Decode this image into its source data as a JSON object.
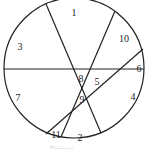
{
  "diagram": {
    "type": "circle-divided-by-chords",
    "stroke_color": "#222222",
    "circle": {
      "cx": 74,
      "cy": 68,
      "r": 70
    },
    "chords": [
      {
        "name": "horizontal",
        "x1": 4,
        "y1": 69,
        "x2": 144,
        "y2": 69
      },
      {
        "name": "steep-down-right",
        "x1": 46,
        "y1": 4,
        "x2": 101,
        "y2": 133
      },
      {
        "name": "steep-down-left",
        "x1": 115,
        "y1": 11,
        "x2": 61,
        "y2": 137
      },
      {
        "name": "shallow-diagonal",
        "x1": 143,
        "y1": 49,
        "x2": 46,
        "y2": 134
      }
    ],
    "regions": [
      {
        "label": "1",
        "x": 74,
        "y": 14
      },
      {
        "label": "2",
        "x": 80,
        "y": 139
      },
      {
        "label": "3",
        "x": 20,
        "y": 48
      },
      {
        "label": "4",
        "x": 133,
        "y": 98
      },
      {
        "label": "5",
        "x": 97,
        "y": 83
      },
      {
        "label": "6",
        "x": 139,
        "y": 70
      },
      {
        "label": "7",
        "x": 18,
        "y": 99
      },
      {
        "label": "8",
        "x": 81,
        "y": 80
      },
      {
        "label": "9",
        "x": 82,
        "y": 101
      },
      {
        "label": "10",
        "x": 124,
        "y": 40
      },
      {
        "label": "11",
        "x": 56,
        "y": 136
      }
    ],
    "caption": "Figure"
  }
}
